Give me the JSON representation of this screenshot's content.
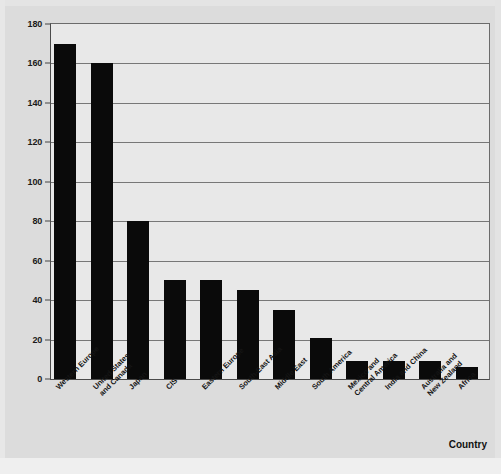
{
  "chart_data": {
    "type": "bar",
    "title": "",
    "subtitle": "",
    "xlabel": "Country",
    "ylabel": "",
    "ylim": [
      0,
      180
    ],
    "yticks": [
      0,
      20,
      40,
      60,
      80,
      100,
      120,
      140,
      160,
      180
    ],
    "ytick_labels": [
      "0",
      "20",
      "40",
      "60",
      "80",
      "100",
      "120",
      "140",
      "160",
      "180"
    ],
    "grid": true,
    "legend": false,
    "legend_position": "none",
    "bar_color": "#0a0a0a",
    "plot_background": "#e8e8e8",
    "figure_background": "#dcdcdc",
    "gridline_color": "#777777",
    "axis_color": "#4a4a4a",
    "categories": [
      "Western Europe",
      "United States\nand Canada",
      "Japan",
      "CIS",
      "Eastern Europe",
      "South-East Asia",
      "Middle East",
      "South America",
      "Mexico and\nCentral America",
      "India and China",
      "Australia and\nNew Zealand",
      "Africa"
    ],
    "values": [
      170,
      160,
      80,
      50,
      50,
      45,
      35,
      21,
      9,
      9,
      9,
      6
    ]
  }
}
